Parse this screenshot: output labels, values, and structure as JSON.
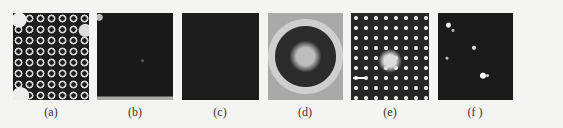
{
  "figure": {
    "panels": [
      {
        "id": "a",
        "label": "(a)",
        "description": "dark field with bright hexagonally arranged rings, bright edges"
      },
      {
        "id": "b",
        "label": "(b)",
        "description": "mostly dark field, faint features"
      },
      {
        "id": "c",
        "label": "(c)",
        "description": "uniformly dark field"
      },
      {
        "id": "d",
        "label": "(d)",
        "description": "circular pattern with bright rim, dark ring of dots, bright center"
      },
      {
        "id": "e",
        "label": "(e)",
        "description": "bright spot lattice with central bright region and scale bar"
      },
      {
        "id": "f",
        "label": "(f )",
        "description": "dark field with few isolated bright spots"
      }
    ]
  }
}
